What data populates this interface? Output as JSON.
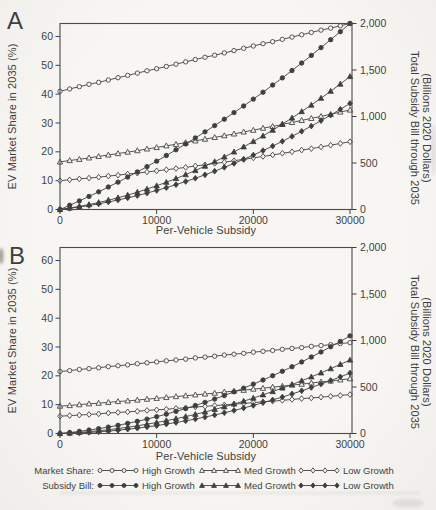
{
  "figure": {
    "width": 436,
    "height": 510
  },
  "colors": {
    "ink": "#3f3f3f",
    "paper": "#f5f4f1",
    "frame": "#4a4a4a"
  },
  "panels": [
    {
      "letter": "A",
      "x_label": "Per-Vehicle Subsidy",
      "y_left_label": "EV Market Share in 2035 (%)",
      "y_right_label_line1": "Total Subsidy Bill through 2035",
      "y_right_label_line2": "(Billions 2020 Dollars)",
      "x_ticks": [
        "0",
        "10000",
        "20000",
        "30000"
      ],
      "y_left_ticks": [
        "0",
        "10",
        "20",
        "30",
        "40",
        "50",
        "60"
      ],
      "y_right_ticks": [
        "0",
        "500",
        "1,000",
        "1,500",
        "2,000"
      ]
    },
    {
      "letter": "B",
      "x_label": "Per-Vehicle Subsidy",
      "y_left_label": "EV Market Share in 2035 (%)",
      "y_right_label_line1": "Total Subsidy Bill through 2035",
      "y_right_label_line2": "(Billions 2020 Dollars)",
      "x_ticks": [
        "0",
        "10000",
        "20000",
        "30000"
      ],
      "y_left_ticks": [
        "0",
        "10",
        "20",
        "30",
        "40",
        "50",
        "60"
      ],
      "y_right_ticks": [
        "0",
        "500",
        "1,000",
        "1,500",
        "2,000"
      ]
    }
  ],
  "legend": {
    "rows": [
      {
        "label": "Market Share:",
        "entries": [
          {
            "label": "High Growth",
            "marker": "circle",
            "filled": false
          },
          {
            "label": "Med Growth",
            "marker": "triangle",
            "filled": false
          },
          {
            "label": "Low Growth",
            "marker": "diamond",
            "filled": false
          }
        ]
      },
      {
        "label": "Subsidy Bill:",
        "entries": [
          {
            "label": "High Growth",
            "marker": "circle",
            "filled": true
          },
          {
            "label": "Med Growth",
            "marker": "triangle",
            "filled": true
          },
          {
            "label": "Low Growth",
            "marker": "diamond",
            "filled": true
          }
        ]
      }
    ]
  },
  "chart_data": [
    {
      "type": "line",
      "panel": "A",
      "xlabel": "Per-Vehicle Subsidy",
      "ylabel_left": "EV Market Share in 2035 (%)",
      "ylabel_right": "Total Subsidy Bill through 2035 (Billions 2020 Dollars)",
      "x_range": [
        0,
        30000
      ],
      "ylim_left": [
        0,
        64.5
      ],
      "ylim_right": [
        0,
        2000
      ],
      "grid": false,
      "x": [
        0,
        1000,
        2000,
        3000,
        4000,
        5000,
        6000,
        7000,
        8000,
        9000,
        10000,
        11000,
        12000,
        13000,
        14000,
        15000,
        16000,
        17000,
        18000,
        19000,
        20000,
        21000,
        22000,
        23000,
        24000,
        25000,
        26000,
        27000,
        28000,
        29000,
        30000
      ],
      "series": [
        {
          "name": "Market Share High Growth",
          "axis": "left",
          "marker": "circle",
          "filled": false,
          "values": [
            41.0,
            41.8,
            42.6,
            43.4,
            44.1,
            44.9,
            45.7,
            46.5,
            47.3,
            48.1,
            48.8,
            49.6,
            50.4,
            51.2,
            52.0,
            52.8,
            53.5,
            54.3,
            55.1,
            55.9,
            56.7,
            57.5,
            58.2,
            59.0,
            59.8,
            60.6,
            61.4,
            62.2,
            62.9,
            63.7,
            64.5
          ]
        },
        {
          "name": "Market Share Med Growth",
          "axis": "left",
          "marker": "triangle",
          "filled": false,
          "values": [
            16.5,
            17.0,
            17.4,
            17.9,
            18.4,
            18.9,
            19.4,
            19.9,
            20.4,
            21.0,
            21.5,
            22.1,
            22.6,
            23.2,
            23.8,
            24.4,
            25.0,
            25.6,
            26.2,
            26.9,
            27.5,
            28.2,
            28.8,
            29.5,
            30.2,
            30.9,
            31.6,
            32.3,
            33.0,
            33.8,
            34.5
          ]
        },
        {
          "name": "Market Share Low Growth",
          "axis": "left",
          "marker": "diamond",
          "filled": false,
          "values": [
            10.0,
            10.3,
            10.6,
            10.9,
            11.2,
            11.6,
            11.9,
            12.3,
            12.6,
            13.0,
            13.4,
            13.8,
            14.2,
            14.6,
            15.1,
            15.5,
            16.0,
            16.4,
            16.9,
            17.4,
            17.9,
            18.4,
            18.9,
            19.5,
            20.0,
            20.6,
            21.1,
            21.7,
            22.3,
            22.9,
            23.5
          ]
        },
        {
          "name": "Subsidy Bill High Growth",
          "axis": "right",
          "marker": "circle",
          "filled": true,
          "values": [
            0,
            45,
            92,
            141,
            190,
            242,
            294,
            349,
            404,
            461,
            520,
            580,
            642,
            705,
            769,
            835,
            902,
            971,
            1042,
            1113,
            1187,
            1261,
            1338,
            1415,
            1494,
            1575,
            1657,
            1741,
            1826,
            1912,
            2000
          ]
        },
        {
          "name": "Subsidy Bill Med Growth",
          "axis": "right",
          "marker": "triangle",
          "filled": true,
          "values": [
            0,
            16,
            33,
            53,
            75,
            100,
            126,
            155,
            186,
            220,
            255,
            293,
            333,
            375,
            419,
            466,
            514,
            565,
            619,
            674,
            731,
            791,
            853,
            918,
            984,
            1053,
            1123,
            1197,
            1272,
            1349,
            1430
          ]
        },
        {
          "name": "Subsidy Bill Low Growth",
          "axis": "right",
          "marker": "diamond",
          "filled": true,
          "values": [
            0,
            13,
            27,
            43,
            61,
            81,
            102,
            125,
            150,
            177,
            205,
            235,
            267,
            301,
            336,
            373,
            412,
            453,
            495,
            539,
            585,
            633,
            682,
            733,
            786,
            841,
            897,
            955,
            1015,
            1077,
            1140
          ]
        }
      ]
    },
    {
      "type": "line",
      "panel": "B",
      "xlabel": "Per-Vehicle Subsidy",
      "ylabel_left": "EV Market Share in 2035 (%)",
      "ylabel_right": "Total Subsidy Bill through 2035 (Billions 2020 Dollars)",
      "x_range": [
        0,
        30000
      ],
      "ylim_left": [
        0,
        64.5
      ],
      "ylim_right": [
        0,
        2000
      ],
      "grid": false,
      "x": [
        0,
        1000,
        2000,
        3000,
        4000,
        5000,
        6000,
        7000,
        8000,
        9000,
        10000,
        11000,
        12000,
        13000,
        14000,
        15000,
        16000,
        17000,
        18000,
        19000,
        20000,
        21000,
        22000,
        23000,
        24000,
        25000,
        26000,
        27000,
        28000,
        29000,
        30000
      ],
      "series": [
        {
          "name": "Market Share High Growth",
          "axis": "left",
          "marker": "circle",
          "filled": false,
          "values": [
            21.5,
            21.8,
            22.2,
            22.5,
            22.8,
            23.2,
            23.5,
            23.8,
            24.2,
            24.5,
            24.8,
            25.2,
            25.5,
            25.8,
            26.2,
            26.5,
            26.8,
            27.2,
            27.5,
            27.8,
            28.2,
            28.5,
            28.8,
            29.2,
            29.5,
            29.8,
            30.2,
            30.5,
            30.8,
            31.2,
            31.5
          ]
        },
        {
          "name": "Market Share Med Growth",
          "axis": "left",
          "marker": "triangle",
          "filled": false,
          "values": [
            9.5,
            9.7,
            10.0,
            10.3,
            10.5,
            10.8,
            11.1,
            11.3,
            11.6,
            11.9,
            12.2,
            12.5,
            12.8,
            13.1,
            13.4,
            13.7,
            14.0,
            14.4,
            14.7,
            15.0,
            15.4,
            15.7,
            16.1,
            16.4,
            16.8,
            17.1,
            17.5,
            17.9,
            18.2,
            18.6,
            19.0
          ]
        },
        {
          "name": "Market Share Low Growth",
          "axis": "left",
          "marker": "diamond",
          "filled": false,
          "values": [
            6.0,
            6.2,
            6.4,
            6.6,
            6.8,
            7.1,
            7.3,
            7.5,
            7.7,
            8.0,
            8.2,
            8.4,
            8.7,
            8.9,
            9.2,
            9.4,
            9.7,
            9.9,
            10.2,
            10.4,
            10.7,
            11.0,
            11.2,
            11.5,
            11.8,
            12.1,
            12.3,
            12.6,
            12.9,
            13.2,
            13.5
          ]
        },
        {
          "name": "Subsidy Bill High Growth",
          "axis": "right",
          "marker": "circle",
          "filled": true,
          "values": [
            0,
            10,
            23,
            37,
            52,
            69,
            88,
            109,
            131,
            155,
            181,
            208,
            238,
            268,
            301,
            335,
            371,
            408,
            448,
            488,
            531,
            575,
            621,
            669,
            718,
            769,
            822,
            877,
            933,
            990,
            1050
          ]
        },
        {
          "name": "Subsidy Bill Med Growth",
          "axis": "right",
          "marker": "triangle",
          "filled": true,
          "values": [
            0,
            5,
            12,
            20,
            30,
            41,
            53,
            67,
            83,
            100,
            118,
            138,
            159,
            182,
            206,
            231,
            259,
            287,
            317,
            348,
            381,
            416,
            451,
            489,
            527,
            567,
            609,
            652,
            697,
            743,
            790
          ]
        },
        {
          "name": "Subsidy Bill Low Growth",
          "axis": "right",
          "marker": "diamond",
          "filled": true,
          "values": [
            0,
            3,
            6,
            12,
            18,
            26,
            35,
            46,
            57,
            71,
            85,
            101,
            118,
            136,
            156,
            177,
            199,
            223,
            248,
            274,
            302,
            331,
            361,
            392,
            425,
            459,
            495,
            532,
            570,
            609,
            650
          ]
        }
      ]
    }
  ]
}
